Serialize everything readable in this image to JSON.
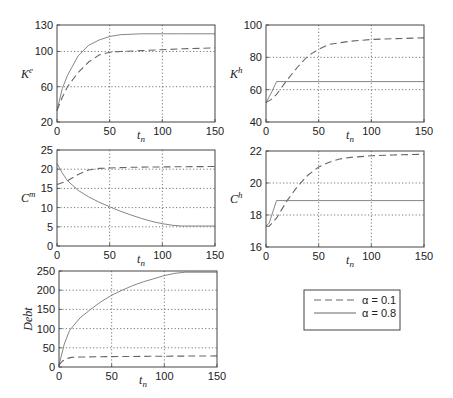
{
  "chart_data": [
    {
      "id": "ke",
      "type": "line",
      "ylabel": "K",
      "ylabel_sup": "e",
      "xlabel": "t",
      "xlabel_sub": "n",
      "xlim": [
        0,
        150
      ],
      "ylim": [
        20,
        130
      ],
      "xticks": [
        0,
        50,
        100,
        150
      ],
      "yticks": [
        20,
        60,
        100,
        130
      ],
      "grid_x": [
        50,
        100
      ],
      "grid_y": [
        60,
        100
      ],
      "series": [
        {
          "name": "α = 0.1",
          "style": "dashed",
          "x": [
            0,
            5,
            10,
            20,
            30,
            40,
            50,
            60,
            80,
            100,
            120,
            150
          ],
          "y": [
            33,
            48,
            60,
            76,
            88,
            96,
            99,
            100,
            101,
            102,
            103,
            104
          ]
        },
        {
          "name": "α = 0.8",
          "style": "solid",
          "x": [
            0,
            5,
            10,
            20,
            30,
            40,
            50,
            60,
            80,
            100,
            120,
            150
          ],
          "y": [
            33,
            58,
            73,
            95,
            107,
            113,
            117,
            119,
            120,
            120,
            120,
            120
          ]
        }
      ]
    },
    {
      "id": "kh",
      "type": "line",
      "ylabel": "K",
      "ylabel_sup": "h",
      "xlabel": "t",
      "xlabel_sub": "n",
      "xlim": [
        0,
        150
      ],
      "ylim": [
        40,
        100
      ],
      "xticks": [
        0,
        50,
        100,
        150
      ],
      "yticks": [
        40,
        60,
        80,
        100
      ],
      "grid_x": [
        50,
        100
      ],
      "grid_y": [
        60,
        80
      ],
      "series": [
        {
          "name": "α = 0.1",
          "style": "dashed",
          "x": [
            0,
            5,
            10,
            20,
            30,
            40,
            50,
            60,
            80,
            100,
            120,
            150
          ],
          "y": [
            52,
            54,
            57,
            66,
            74,
            81,
            85,
            88,
            90,
            91,
            91.5,
            92
          ]
        },
        {
          "name": "α = 0.8",
          "style": "solid",
          "x": [
            0,
            5,
            10,
            15,
            50,
            100,
            150
          ],
          "y": [
            52,
            58,
            65,
            65,
            65,
            65,
            65
          ]
        }
      ]
    },
    {
      "id": "cm",
      "type": "line",
      "ylabel": "C",
      "ylabel_sup": "m",
      "xlabel": "t",
      "xlabel_sub": "n",
      "xlim": [
        0,
        150
      ],
      "ylim": [
        0,
        25
      ],
      "xticks": [
        0,
        50,
        100,
        150
      ],
      "yticks": [
        0,
        5,
        10,
        15,
        20,
        25
      ],
      "grid_x": [
        50,
        100
      ],
      "grid_y": [
        5,
        10,
        15,
        20
      ],
      "series": [
        {
          "name": "α = 0.1",
          "style": "dashed",
          "x": [
            0,
            10,
            20,
            30,
            40,
            50,
            70,
            100,
            150
          ],
          "y": [
            16,
            17,
            18.6,
            19.8,
            20.2,
            20.3,
            20.5,
            20.6,
            20.7
          ]
        },
        {
          "name": "α = 0.8",
          "style": "solid",
          "x": [
            0,
            5,
            10,
            20,
            30,
            40,
            50,
            60,
            70,
            80,
            90,
            100,
            110,
            118,
            150
          ],
          "y": [
            21.5,
            19,
            17,
            14.5,
            12.8,
            11.4,
            10.2,
            9.1,
            8.1,
            7.2,
            6.4,
            5.8,
            5.4,
            5.2,
            5.2
          ]
        }
      ]
    },
    {
      "id": "ch",
      "type": "line",
      "ylabel": "C",
      "ylabel_sup": "h",
      "xlabel": "t",
      "xlabel_sub": "n",
      "xlim": [
        0,
        150
      ],
      "ylim": [
        16,
        22
      ],
      "xticks": [
        0,
        50,
        100,
        150
      ],
      "yticks": [
        16,
        18,
        20,
        22
      ],
      "grid_x": [
        50,
        100
      ],
      "grid_y": [
        18,
        20
      ],
      "series": [
        {
          "name": "α = 0.1",
          "style": "dashed",
          "x": [
            0,
            3,
            10,
            20,
            30,
            40,
            50,
            60,
            70,
            80,
            100,
            120,
            150
          ],
          "y": [
            17.3,
            17.3,
            17.8,
            18.9,
            19.8,
            20.5,
            21.0,
            21.3,
            21.5,
            21.6,
            21.7,
            21.75,
            21.8
          ]
        },
        {
          "name": "α = 0.8",
          "style": "solid",
          "x": [
            0,
            3,
            10,
            50,
            100,
            150
          ],
          "y": [
            17.3,
            17.5,
            18.9,
            18.9,
            18.9,
            18.9
          ]
        }
      ]
    },
    {
      "id": "debt",
      "type": "line",
      "ylabel": "Debt",
      "ylabel_sup": "",
      "xlabel": "t",
      "xlabel_sub": "n",
      "xlim": [
        0,
        150
      ],
      "ylim": [
        0,
        250
      ],
      "xticks": [
        0,
        50,
        100,
        150
      ],
      "yticks": [
        0,
        50,
        100,
        150,
        200,
        250
      ],
      "grid_x": [
        50,
        100
      ],
      "grid_y": [
        50,
        100,
        150,
        200
      ],
      "series": [
        {
          "name": "α = 0.1",
          "style": "dashed",
          "x": [
            0,
            3,
            7,
            12,
            20,
            50,
            100,
            150
          ],
          "y": [
            5,
            15,
            22,
            25,
            26,
            27,
            28,
            29
          ]
        },
        {
          "name": "α = 0.8",
          "style": "solid",
          "x": [
            0,
            5,
            10,
            20,
            30,
            40,
            50,
            60,
            70,
            80,
            90,
            100,
            110,
            120,
            150
          ],
          "y": [
            5,
            60,
            95,
            128,
            150,
            170,
            187,
            200,
            212,
            222,
            230,
            238,
            244,
            247,
            247
          ]
        }
      ]
    }
  ],
  "legend": {
    "entries": [
      {
        "label": "α = 0.1",
        "style": "dashed"
      },
      {
        "label": "α = 0.8",
        "style": "solid"
      }
    ],
    "placement": "bottom-right"
  }
}
